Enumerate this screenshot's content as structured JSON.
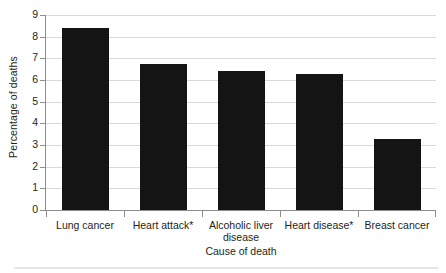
{
  "chart_data": {
    "type": "bar",
    "title": "",
    "xlabel": "Cause of death",
    "ylabel": "Percentage of deaths",
    "categories": [
      "Lung cancer",
      "Heart attack*",
      "Alcoholic liver disease",
      "Heart disease*",
      "Breast cancer"
    ],
    "values": [
      8.4,
      6.75,
      6.4,
      6.3,
      3.3
    ],
    "ylim": [
      0,
      9
    ],
    "ytick_labels": [
      "0",
      "1",
      "2",
      "3",
      "4",
      "5",
      "6",
      "7",
      "8",
      "9"
    ],
    "ytick_values": [
      0,
      1,
      2,
      3,
      4,
      5,
      6,
      7,
      8,
      9
    ],
    "grid": true,
    "legend": "none",
    "bar_color": "#141414",
    "gridline_color": "#d9d9d9",
    "axis_color": "#8d8d8d"
  },
  "axes": {
    "y_title": "Percentage of deaths",
    "x_title": "Cause of death"
  }
}
